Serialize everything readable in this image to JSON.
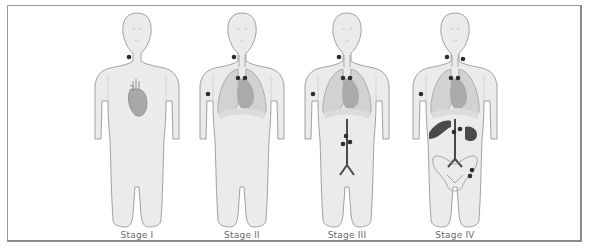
{
  "figure": {
    "type": "cancer staging illustration",
    "stages": [
      {
        "label": "Stage I",
        "center_x": 137,
        "organs": [
          "heart"
        ],
        "lymph_nodes": [
          "left neck"
        ]
      },
      {
        "label": "Stage II",
        "center_x": 242,
        "organs": [
          "lungs",
          "heart"
        ],
        "lymph_nodes": [
          "left neck",
          "right axilla",
          "mediastinal x2"
        ]
      },
      {
        "label": "Stage III",
        "center_x": 347,
        "organs": [
          "lungs",
          "heart",
          "abdominal aorta"
        ],
        "lymph_nodes": [
          "left neck",
          "right axilla",
          "mediastinal x2",
          "para-aortic x3"
        ]
      },
      {
        "label": "Stage IV",
        "center_x": 455,
        "organs": [
          "lungs",
          "heart",
          "liver",
          "spleen",
          "abdominal aorta",
          "pelvis"
        ],
        "lymph_nodes": [
          "left neck",
          "right neck",
          "right axilla",
          "mediastinal x2",
          "para-aortic x2",
          "iliac x2"
        ]
      }
    ]
  },
  "colors": {
    "body_fill": "#ebebeb",
    "body_stroke": "#8c8c8c",
    "lung_fill": "#cfcfcf",
    "heart_fill": "#a9a9a9",
    "node_fill": "#2e2e2e",
    "organ_dark": "#4a4a4a",
    "frame": "#8a8a8a",
    "label": "#6a6a6a"
  }
}
